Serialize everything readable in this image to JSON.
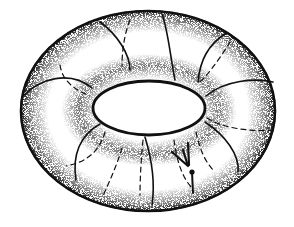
{
  "figure": {
    "subject": "torus",
    "colors": {
      "ink": "#111111",
      "background": "#ffffff",
      "stipple": "#222222"
    },
    "outer_ellipse": {
      "cx": 148,
      "cy": 111,
      "rx": 128,
      "ry": 101
    },
    "hole_ellipse": {
      "cx": 149,
      "cy": 108,
      "rx": 56,
      "ry": 28
    },
    "marked_point": {
      "x": 192,
      "y": 172
    },
    "arrow": {
      "from": [
        175,
        143
      ],
      "to": [
        187,
        165
      ]
    }
  }
}
